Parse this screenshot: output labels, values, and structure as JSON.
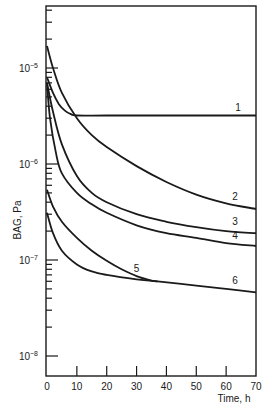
{
  "chart_data": {
    "type": "line",
    "title": "",
    "xlabel": "Time, h",
    "ylabel": "BAG, Pa",
    "xlim": [
      0,
      70
    ],
    "ylim": [
      1e-08,
      6e-05
    ],
    "yscale": "log",
    "x_ticks": [
      0,
      10,
      20,
      30,
      40,
      50,
      60,
      70
    ],
    "x_tick_labels": [
      "0",
      "10",
      "20",
      "30",
      "40",
      "50",
      "60",
      "70"
    ],
    "y_ticks": [
      1e-05,
      1e-06,
      1e-07,
      1e-08
    ],
    "y_tick_labels": [
      {
        "base": "10",
        "exp": "−5"
      },
      {
        "base": "10",
        "exp": "−6"
      },
      {
        "base": "10",
        "exp": "−7"
      },
      {
        "base": "10",
        "exp": "−8"
      }
    ],
    "grid": false,
    "legend": "inline curve labels",
    "series": [
      {
        "name": "1",
        "x": [
          0,
          2,
          4,
          6,
          8,
          10,
          20,
          40,
          70
        ],
        "values": [
          8e-06,
          5.5e-06,
          4.2e-06,
          3.6e-06,
          3.3e-06,
          3.2e-06,
          3.2e-06,
          3.2e-06,
          3.2e-06
        ]
      },
      {
        "name": "2",
        "x": [
          0,
          2,
          5,
          10,
          15,
          20,
          30,
          40,
          50,
          60,
          70
        ],
        "values": [
          1.7e-05,
          1e-05,
          5.5e-06,
          3e-06,
          2e-06,
          1.5e-06,
          9.5e-07,
          6.5e-07,
          4.8e-07,
          3.9e-07,
          3.4e-07
        ]
      },
      {
        "name": "3",
        "x": [
          0,
          2,
          5,
          10,
          15,
          20,
          30,
          40,
          50,
          60,
          70
        ],
        "values": [
          7e-06,
          3.5e-06,
          1.6e-06,
          7.5e-07,
          5e-07,
          4e-07,
          3e-07,
          2.5e-07,
          2.2e-07,
          2e-07,
          1.9e-07
        ]
      },
      {
        "name": "4",
        "x": [
          0,
          1,
          3,
          5,
          10,
          15,
          20,
          30,
          40,
          50,
          60,
          70
        ],
        "values": [
          7e-06,
          3e-06,
          1.3e-06,
          8e-07,
          5e-07,
          3.8e-07,
          3.1e-07,
          2.3e-07,
          1.9e-07,
          1.7e-07,
          1.5e-07,
          1.4e-07
        ]
      },
      {
        "name": "5",
        "x": [
          0,
          2,
          5,
          10,
          15,
          20,
          25,
          30,
          35,
          37
        ],
        "values": [
          5.4e-07,
          3.6e-07,
          2.5e-07,
          1.7e-07,
          1.25e-07,
          9.8e-08,
          8e-08,
          6.8e-08,
          6.1e-08,
          6e-08
        ]
      },
      {
        "name": "6",
        "x": [
          0,
          2,
          5,
          10,
          15,
          20,
          30,
          37,
          50,
          60,
          70
        ],
        "values": [
          3.1e-07,
          1.9e-07,
          1.25e-07,
          9e-08,
          7.6e-08,
          7e-08,
          6.3e-08,
          6e-08,
          5.4e-08,
          5e-08,
          4.6e-08
        ]
      }
    ],
    "curve_labels": [
      {
        "text": "1",
        "x": 64,
        "y": 3.6e-06
      },
      {
        "text": "2",
        "x": 63,
        "y": 4.2e-07
      },
      {
        "text": "3",
        "x": 63,
        "y": 2.3e-07
      },
      {
        "text": "4",
        "x": 63,
        "y": 1.65e-07
      },
      {
        "text": "5",
        "x": 30,
        "y": 7.5e-08
      },
      {
        "text": "6",
        "x": 63,
        "y": 5.6e-08
      }
    ]
  }
}
